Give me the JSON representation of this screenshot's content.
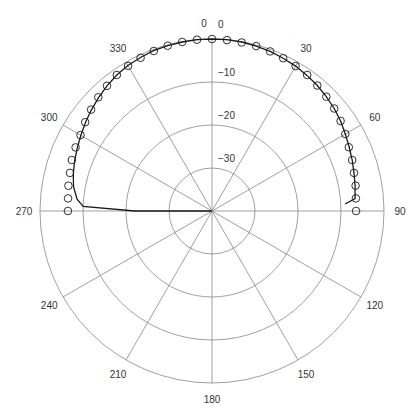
{
  "chart_data": {
    "type": "polar",
    "title": "",
    "angular_axis": {
      "direction": "clockwise",
      "zero_location": "top",
      "tick_labels": [
        "0",
        "30",
        "60",
        "90",
        "120",
        "150",
        "180",
        "210",
        "240",
        "270",
        "300",
        "330"
      ],
      "tick_angles": [
        0,
        30,
        60,
        90,
        120,
        150,
        180,
        210,
        240,
        270,
        300,
        330
      ]
    },
    "radial_axis": {
      "range": [
        -40,
        0
      ],
      "tick_values": [
        0,
        -10,
        -20,
        -30
      ],
      "tick_labels": [
        "0",
        "−10",
        "−20",
        "−30"
      ],
      "label_angle": 5
    },
    "series": [
      {
        "name": "measured",
        "style": "markers",
        "marker": "open-circle",
        "angles": [
          270,
          275,
          280,
          285,
          290,
          295,
          300,
          305,
          310,
          315,
          320,
          325,
          330,
          335,
          340,
          345,
          350,
          355,
          0,
          5,
          10,
          15,
          20,
          25,
          30,
          35,
          40,
          45,
          50,
          55,
          60,
          65,
          70,
          75,
          80,
          85,
          90
        ],
        "values": [
          -6.5,
          -6.4,
          -6.1,
          -5.8,
          -5.3,
          -5.0,
          -4.7,
          -4.0,
          -3.3,
          -2.6,
          -2.0,
          -1.4,
          -1.0,
          -0.7,
          -0.4,
          -0.2,
          -0.1,
          0.0,
          0.0,
          -0.1,
          -0.2,
          -0.3,
          -0.5,
          -0.8,
          -1.1,
          -1.4,
          -1.9,
          -2.4,
          -2.9,
          -3.5,
          -4.2,
          -4.9,
          -5.3,
          -5.8,
          -6.1,
          -6.4,
          -6.5
        ]
      },
      {
        "name": "model",
        "style": "line",
        "angles": [
          268,
          270,
          272,
          275,
          280,
          285,
          290,
          295,
          300,
          305,
          310,
          315,
          320,
          325,
          330,
          335,
          340,
          345,
          350,
          355,
          0,
          5,
          10,
          15,
          20,
          25,
          30,
          35,
          40,
          45,
          50,
          55,
          60,
          65,
          70,
          75,
          80,
          85,
          87
        ],
        "values": [
          -40,
          -22,
          -10,
          -8.5,
          -7.3,
          -6.6,
          -6.0,
          -5.4,
          -4.8,
          -4.1,
          -3.4,
          -2.7,
          -2.0,
          -1.4,
          -0.9,
          -0.6,
          -0.3,
          -0.2,
          -0.1,
          0.0,
          0.0,
          0.0,
          -0.1,
          -0.3,
          -0.5,
          -0.8,
          -1.1,
          -1.5,
          -1.9,
          -2.4,
          -2.9,
          -3.5,
          -4.2,
          -4.8,
          -5.3,
          -5.8,
          -6.2,
          -6.6,
          -9.0
        ]
      }
    ],
    "grid": true,
    "legend": null
  }
}
